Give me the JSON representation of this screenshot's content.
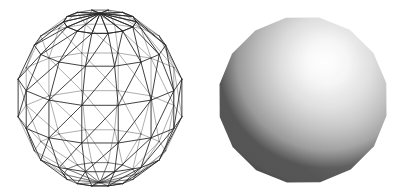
{
  "figure": {
    "background_color": "#ffffff",
    "width": 410,
    "height": 193,
    "panel_count": 2
  },
  "wireframe": {
    "label": "wireframe-sphere",
    "description": "Transparent triangulated latitude-longitude sphere mesh",
    "line_color": "#2b2b2b",
    "line_width": 0.9,
    "fill": "none",
    "center_x": 100,
    "center_y": 98,
    "radius_x": 84,
    "radius_y": 89,
    "latitude_bands": 7,
    "longitude_segments": 14,
    "triangulated": true,
    "hidden_lines_removed": false,
    "projection": "orthographic",
    "tilt_degrees": 18
  },
  "shaded": {
    "label": "shaded-sphere",
    "description": "Gouraud-shaded grayscale polygonal sphere, light from upper right",
    "center_x": 303,
    "center_y": 100,
    "radius_x": 85,
    "radius_y": 84,
    "silhouette_segments": 16,
    "highlight_x": 322,
    "highlight_y": 62,
    "highlight_color": "#fbfbfb",
    "midtone_color": "#a8a8a8",
    "shadow_color": "#2e2e2e",
    "terminator_color": "#565656",
    "light_direction": "upper-right",
    "shading_model": "smooth"
  },
  "colors": {
    "ink": "#2b2b2b",
    "paper": "#ffffff",
    "highlight": "#fbfbfb",
    "shadow": "#2e2e2e"
  }
}
